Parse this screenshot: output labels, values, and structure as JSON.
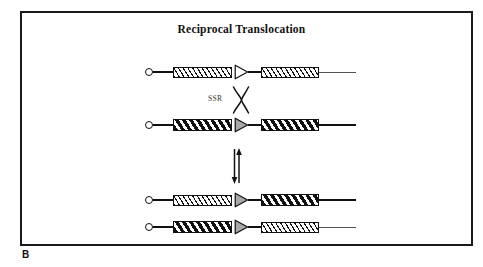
{
  "figure": {
    "panel_letter": "B",
    "title": "Reciprocal Translocation",
    "frame_color": "#1a1a1a",
    "background": "#ffffff"
  },
  "annotations": {
    "ssr_label": "SSR",
    "crossover_icon": "x-crossover-icon",
    "equilibrium_icon": "double-arrow-icon"
  },
  "diagram_data": {
    "type": "diagram",
    "subject": "Site-specific recombination producing a reciprocal translocation between two chromosomes",
    "substrate_rows": 2,
    "product_rows": 2,
    "rows": [
      {
        "id": "substrate-chromosome-1",
        "role": "substrate",
        "left_arm_fill": "thin-hatch",
        "right_arm_fill": "thin-hatch",
        "backbone_weight": "thin",
        "triangle_fill": "white",
        "telomere": "open-circle"
      },
      {
        "id": "substrate-chromosome-2",
        "role": "substrate",
        "left_arm_fill": "thick-hatch",
        "right_arm_fill": "thick-hatch",
        "backbone_weight": "thick",
        "triangle_fill": "gray",
        "telomere": "open-circle"
      },
      {
        "id": "product-chromosome-1",
        "role": "product",
        "left_arm_fill": "thin-hatch",
        "right_arm_fill": "thick-hatch",
        "backbone_weight": "mixed",
        "triangle_fill": "gray",
        "telomere": "open-circle"
      },
      {
        "id": "product-chromosome-2",
        "role": "product",
        "left_arm_fill": "thick-hatch",
        "right_arm_fill": "thin-hatch",
        "backbone_weight": "mixed",
        "triangle_fill": "gray",
        "telomere": "open-circle"
      }
    ],
    "colors": {
      "line": "#111111",
      "triangle_gray": "#a8a8a8",
      "triangle_white": "#ffffff"
    }
  }
}
